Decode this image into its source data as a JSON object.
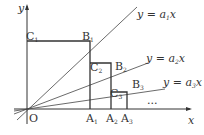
{
  "diagram": {
    "axes": {
      "x_label": "x",
      "y_label": "y",
      "origin_label": "O"
    },
    "lines": [
      {
        "label": "y = a₁x",
        "prefix": "y = a",
        "sub": "1",
        "suffix": "x"
      },
      {
        "label": "y = a₂x",
        "prefix": "y = a",
        "sub": "2",
        "suffix": "x"
      },
      {
        "label": "y = a₃x",
        "prefix": "y = a",
        "sub": "3",
        "suffix": "x"
      }
    ],
    "points": {
      "A": [
        {
          "base": "A",
          "sub": "1"
        },
        {
          "base": "A",
          "sub": "2"
        },
        {
          "base": "A",
          "sub": "3"
        }
      ],
      "B": [
        {
          "base": "B",
          "sub": "1"
        },
        {
          "base": "B",
          "sub": "2"
        },
        {
          "base": "B",
          "sub": "3"
        }
      ],
      "C": [
        {
          "base": "C",
          "sub": "1"
        },
        {
          "base": "C",
          "sub": "2"
        },
        {
          "base": "C",
          "sub": "3"
        }
      ]
    },
    "ellipsis": "..."
  }
}
